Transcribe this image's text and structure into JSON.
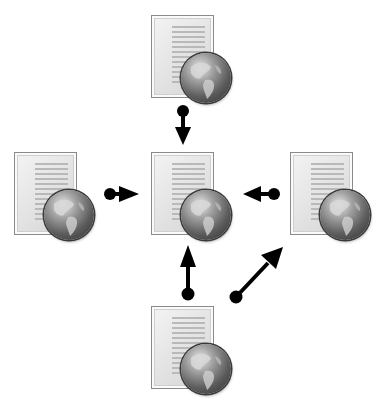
{
  "diagram": {
    "nodes": [
      {
        "id": "top",
        "icon": "web-document-icon"
      },
      {
        "id": "center",
        "icon": "web-document-icon"
      },
      {
        "id": "left",
        "icon": "web-document-icon"
      },
      {
        "id": "right",
        "icon": "web-document-icon"
      },
      {
        "id": "bottom",
        "icon": "web-document-icon"
      }
    ],
    "edges": [
      {
        "from": "top",
        "to": "center",
        "style": "dot-tail-arrow"
      },
      {
        "from": "left",
        "to": "center",
        "style": "dot-tail-arrow"
      },
      {
        "from": "right",
        "to": "center",
        "style": "dot-tail-arrow"
      },
      {
        "from": "bottom",
        "to": "center",
        "style": "dot-tail-arrow"
      },
      {
        "from": "bottom",
        "to": "right",
        "style": "dot-tail-arrow"
      }
    ],
    "colors": {
      "arrow": "#000000",
      "document_border": "#8a8a8a",
      "document_fill": "#e6e6e6",
      "globe": "#5c5c5c"
    }
  }
}
